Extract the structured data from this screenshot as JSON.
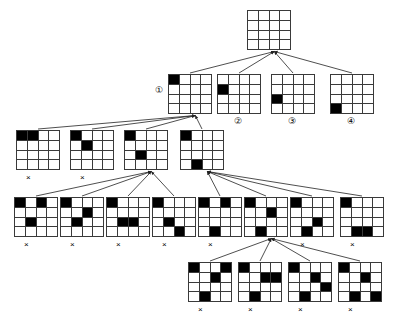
{
  "diagram": {
    "grid_size": 4,
    "colors": {
      "filled_cell": "#000000",
      "empty_cell": "#ffffff",
      "grid_line": "#3a3a3a",
      "arrow": "#222222",
      "background": "#ffffff"
    },
    "legend": {
      "dead_end_marker": "×",
      "circled_labels": [
        "①",
        "②",
        "③",
        "④"
      ]
    }
  },
  "nodes": [
    {
      "id": "root",
      "level": 0,
      "x": 247,
      "y": 10,
      "w": 44,
      "h": 40,
      "cells": [],
      "dead_end": false,
      "label": ""
    },
    {
      "id": "L1N1",
      "level": 1,
      "x": 168,
      "y": 74,
      "w": 44,
      "h": 40,
      "cells": [
        [
          1,
          1
        ]
      ],
      "dead_end": false,
      "label": "①",
      "label_x": 155,
      "label_y": 86
    },
    {
      "id": "L1N2",
      "level": 1,
      "x": 217,
      "y": 74,
      "w": 44,
      "h": 40,
      "cells": [
        [
          2,
          1
        ]
      ],
      "dead_end": false,
      "label": "②",
      "label_x": 234,
      "label_y": 117
    },
    {
      "id": "L1N3",
      "level": 1,
      "x": 271,
      "y": 74,
      "w": 44,
      "h": 40,
      "cells": [
        [
          3,
          1
        ]
      ],
      "dead_end": false,
      "label": "③",
      "label_x": 288,
      "label_y": 117
    },
    {
      "id": "L1N4",
      "level": 1,
      "x": 330,
      "y": 74,
      "w": 44,
      "h": 40,
      "cells": [
        [
          4,
          1
        ]
      ],
      "dead_end": false,
      "label": "④",
      "label_x": 347,
      "label_y": 117
    },
    {
      "id": "L2N1",
      "level": 2,
      "x": 16,
      "y": 130,
      "w": 44,
      "h": 40,
      "cells": [
        [
          1,
          1
        ],
        [
          1,
          2
        ]
      ],
      "dead_end": true,
      "x_x": 26,
      "x_y": 174,
      "label": ""
    },
    {
      "id": "L2N2",
      "level": 2,
      "x": 70,
      "y": 130,
      "w": 44,
      "h": 40,
      "cells": [
        [
          1,
          1
        ],
        [
          2,
          2
        ]
      ],
      "dead_end": true,
      "x_x": 80,
      "x_y": 174,
      "label": ""
    },
    {
      "id": "L2N3",
      "level": 2,
      "x": 124,
      "y": 130,
      "w": 44,
      "h": 40,
      "cells": [
        [
          1,
          1
        ],
        [
          3,
          2
        ]
      ],
      "dead_end": false,
      "label": ""
    },
    {
      "id": "L2N4",
      "level": 2,
      "x": 180,
      "y": 130,
      "w": 44,
      "h": 40,
      "cells": [
        [
          1,
          1
        ],
        [
          4,
          2
        ]
      ],
      "dead_end": false,
      "label": ""
    },
    {
      "id": "L3N1",
      "level": 3,
      "x": 14,
      "y": 197,
      "w": 44,
      "h": 40,
      "cells": [
        [
          1,
          1
        ],
        [
          1,
          3
        ],
        [
          3,
          2
        ]
      ],
      "dead_end": true,
      "x_x": 24,
      "x_y": 241,
      "label": ""
    },
    {
      "id": "L3N2",
      "level": 3,
      "x": 60,
      "y": 197,
      "w": 44,
      "h": 40,
      "cells": [
        [
          1,
          1
        ],
        [
          2,
          3
        ],
        [
          3,
          2
        ]
      ],
      "dead_end": true,
      "x_x": 70,
      "x_y": 241,
      "label": ""
    },
    {
      "id": "L3N3",
      "level": 3,
      "x": 106,
      "y": 197,
      "w": 44,
      "h": 40,
      "cells": [
        [
          1,
          1
        ],
        [
          3,
          2
        ],
        [
          3,
          3
        ]
      ],
      "dead_end": true,
      "x_x": 116,
      "x_y": 241,
      "label": ""
    },
    {
      "id": "L3N4",
      "level": 3,
      "x": 152,
      "y": 197,
      "w": 44,
      "h": 40,
      "cells": [
        [
          1,
          1
        ],
        [
          3,
          2
        ],
        [
          4,
          3
        ]
      ],
      "dead_end": true,
      "x_x": 162,
      "x_y": 241,
      "label": ""
    },
    {
      "id": "L3N5",
      "level": 3,
      "x": 198,
      "y": 197,
      "w": 44,
      "h": 40,
      "cells": [
        [
          1,
          1
        ],
        [
          1,
          3
        ],
        [
          4,
          2
        ]
      ],
      "dead_end": true,
      "x_x": 208,
      "x_y": 241,
      "label": ""
    },
    {
      "id": "L3N6",
      "level": 3,
      "x": 244,
      "y": 197,
      "w": 44,
      "h": 40,
      "cells": [
        [
          1,
          1
        ],
        [
          2,
          3
        ],
        [
          4,
          2
        ]
      ],
      "dead_end": false,
      "label": ""
    },
    {
      "id": "L3N7",
      "level": 3,
      "x": 290,
      "y": 197,
      "w": 44,
      "h": 40,
      "cells": [
        [
          1,
          1
        ],
        [
          3,
          3
        ],
        [
          4,
          2
        ]
      ],
      "dead_end": true,
      "x_x": 300,
      "x_y": 241,
      "label": ""
    },
    {
      "id": "L3N8",
      "level": 3,
      "x": 340,
      "y": 197,
      "w": 44,
      "h": 40,
      "cells": [
        [
          1,
          1
        ],
        [
          4,
          2
        ],
        [
          4,
          3
        ]
      ],
      "dead_end": true,
      "x_x": 350,
      "x_y": 241,
      "label": ""
    },
    {
      "id": "L4N1",
      "level": 4,
      "x": 188,
      "y": 262,
      "w": 44,
      "h": 40,
      "cells": [
        [
          1,
          1
        ],
        [
          1,
          4
        ],
        [
          2,
          3
        ],
        [
          4,
          2
        ]
      ],
      "dead_end": true,
      "x_x": 198,
      "x_y": 306,
      "label": ""
    },
    {
      "id": "L4N2",
      "level": 4,
      "x": 238,
      "y": 262,
      "w": 44,
      "h": 40,
      "cells": [
        [
          1,
          1
        ],
        [
          2,
          3
        ],
        [
          2,
          4
        ],
        [
          4,
          2
        ]
      ],
      "dead_end": true,
      "x_x": 248,
      "x_y": 306,
      "label": ""
    },
    {
      "id": "L4N3",
      "level": 4,
      "x": 288,
      "y": 262,
      "w": 44,
      "h": 40,
      "cells": [
        [
          1,
          1
        ],
        [
          2,
          3
        ],
        [
          3,
          4
        ],
        [
          4,
          2
        ]
      ],
      "dead_end": true,
      "x_x": 298,
      "x_y": 306,
      "label": ""
    },
    {
      "id": "L4N4",
      "level": 4,
      "x": 338,
      "y": 262,
      "w": 44,
      "h": 40,
      "cells": [
        [
          1,
          1
        ],
        [
          2,
          3
        ],
        [
          4,
          2
        ],
        [
          4,
          4
        ]
      ],
      "dead_end": true,
      "x_x": 348,
      "x_y": 306,
      "label": ""
    }
  ],
  "edges": [
    {
      "from": "L1N1",
      "to": "root"
    },
    {
      "from": "L1N2",
      "to": "root"
    },
    {
      "from": "L1N3",
      "to": "root"
    },
    {
      "from": "L1N4",
      "to": "root"
    },
    {
      "from": "L2N1",
      "to": "L1N1"
    },
    {
      "from": "L2N2",
      "to": "L1N1"
    },
    {
      "from": "L2N3",
      "to": "L1N1"
    },
    {
      "from": "L2N4",
      "to": "L1N1"
    },
    {
      "from": "L3N1",
      "to": "L2N3"
    },
    {
      "from": "L3N2",
      "to": "L2N3"
    },
    {
      "from": "L3N3",
      "to": "L2N3"
    },
    {
      "from": "L3N4",
      "to": "L2N3"
    },
    {
      "from": "L3N5",
      "to": "L2N4"
    },
    {
      "from": "L3N6",
      "to": "L2N4"
    },
    {
      "from": "L3N7",
      "to": "L2N4"
    },
    {
      "from": "L3N8",
      "to": "L2N4"
    },
    {
      "from": "L4N1",
      "to": "L3N6"
    },
    {
      "from": "L4N2",
      "to": "L3N6"
    },
    {
      "from": "L4N3",
      "to": "L3N6"
    },
    {
      "from": "L4N4",
      "to": "L3N6"
    }
  ]
}
